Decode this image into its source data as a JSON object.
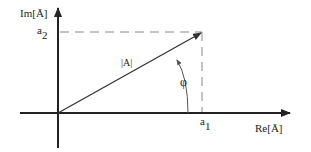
{
  "diagram": {
    "axes": {
      "imaginary_label": "Im[Ā]",
      "real_label": "Re[Ā]"
    },
    "vector": {
      "magnitude_label": "|A|"
    },
    "components": {
      "real_label": "a",
      "real_subscript": "1",
      "imag_label": "a",
      "imag_subscript": "2"
    },
    "angle": {
      "label": "φ"
    },
    "colors": {
      "axis": "#222222",
      "vector": "#333333",
      "dashed": "#888888",
      "background": "#ffffff"
    }
  }
}
